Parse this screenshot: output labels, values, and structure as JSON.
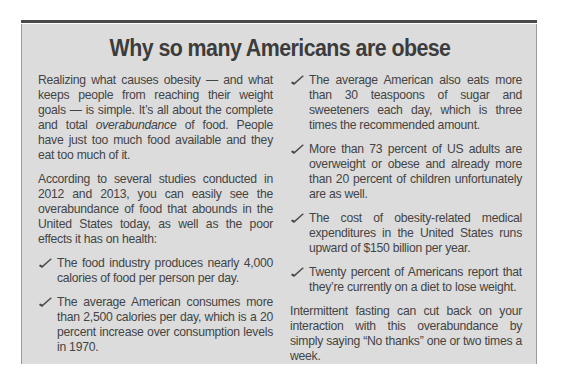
{
  "sidebar": {
    "title": "Why so many Americans are obese",
    "left_column": {
      "intro": {
        "part1": "Realizing what causes obesity — and what keeps people from reaching their weight goals — is simple. It’s all about the complete and total ",
        "emphasis": "overabundance",
        "part2": " of food. People have just too much food available and they eat too much of it."
      },
      "studies": "According to several studies conducted in 2012 and 2013, you can easily see the overabundance of food that abounds in the United States today, as well as the poor effects it has on health:",
      "bullets": [
        "The food industry produces nearly 4,000 calories of food per person per day.",
        "The average American consumes more than 2,500 calories per day, which is a 20 percent increase over consumption levels in 1970."
      ]
    },
    "right_column": {
      "bullets": [
        "The average American also eats more than 30 teaspoons of sugar and sweeteners each day, which is three times the recommended amount.",
        "More than 73 percent of US adults are overweight or obese and already more than 20 percent of children unfortunately are as well.",
        "The cost of obesity-related medical expenditures in the United States runs upward of $150 billion per year.",
        "Twenty percent of Americans report that they’re currently on a diet to lose weight."
      ],
      "closing": "Intermittent fasting can cut back on your interaction with this overabundance by simply saying “No thanks” one or two times a week."
    },
    "bullet_icon": "checkmark-icon",
    "colors": {
      "box_background": "#dcdcdc",
      "top_rule": "#4a4a4a",
      "text": "#444444"
    }
  }
}
